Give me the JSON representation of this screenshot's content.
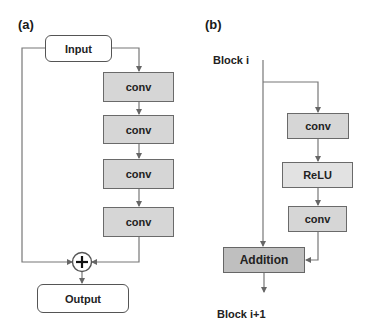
{
  "panel_a": {
    "label": "(a)",
    "input": "Input",
    "layers": [
      "conv",
      "conv",
      "conv",
      "conv"
    ],
    "merge": "plus-icon",
    "output": "Output"
  },
  "panel_b": {
    "label": "(b)",
    "block_in": "Block i",
    "layers": [
      "conv",
      "ReLU",
      "conv"
    ],
    "addition": "Addition",
    "block_out": "Block i+1"
  },
  "colors": {
    "line": "#666666",
    "conv_fill": "#d6d6d6",
    "relu_fill": "#e2e2e2",
    "addition_fill": "#bfbfbf",
    "io_fill": "#ffffff"
  }
}
